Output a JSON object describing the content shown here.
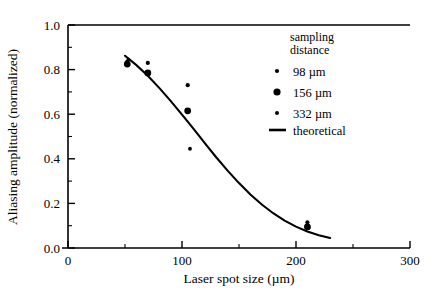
{
  "chart_data": {
    "type": "scatter",
    "title": "",
    "xlabel": "Laser spot size (µm)",
    "ylabel": "Aliasing amplitude (normalized)",
    "xlim": [
      0,
      300
    ],
    "ylim": [
      0.0,
      1.0
    ],
    "xticks": [
      0,
      100,
      200,
      300
    ],
    "xtick_labels": [
      "0",
      "100",
      "200",
      "300"
    ],
    "xticks_minor": [
      50,
      150,
      250
    ],
    "yticks": [
      0.0,
      0.2,
      0.4,
      0.6,
      0.8,
      1.0
    ],
    "ytick_labels": [
      "0.0",
      "0.2",
      "0.4",
      "0.6",
      "0.8",
      "1.0"
    ],
    "yticks_minor": [
      0.1,
      0.3,
      0.5,
      0.7,
      0.9
    ],
    "grid": false,
    "legend_position": "upper right",
    "legend_title": "sampling distance",
    "series": [
      {
        "name": "98 µm",
        "marker": "small-dot",
        "marker_radius": 2.1,
        "points": [
          {
            "x": 52,
            "y": 0.835
          },
          {
            "x": 70,
            "y": 0.83
          },
          {
            "x": 105,
            "y": 0.73
          },
          {
            "x": 210,
            "y": 0.115
          }
        ]
      },
      {
        "name": "156 µm",
        "marker": "large-dot",
        "marker_radius": 3.4,
        "points": [
          {
            "x": 52,
            "y": 0.825
          },
          {
            "x": 70,
            "y": 0.785
          },
          {
            "x": 105,
            "y": 0.615
          },
          {
            "x": 210,
            "y": 0.095
          }
        ]
      },
      {
        "name": "332 µm",
        "marker": "small-dot",
        "marker_radius": 1.9,
        "points": [
          {
            "x": 53,
            "y": 0.845
          },
          {
            "x": 107,
            "y": 0.445
          },
          {
            "x": 211,
            "y": 0.09
          }
        ]
      },
      {
        "name": "theoretical",
        "marker": "line",
        "curve": [
          {
            "x": 50,
            "y": 0.862
          },
          {
            "x": 60,
            "y": 0.82
          },
          {
            "x": 70,
            "y": 0.772
          },
          {
            "x": 80,
            "y": 0.718
          },
          {
            "x": 90,
            "y": 0.66
          },
          {
            "x": 100,
            "y": 0.598
          },
          {
            "x": 110,
            "y": 0.535
          },
          {
            "x": 120,
            "y": 0.47
          },
          {
            "x": 130,
            "y": 0.407
          },
          {
            "x": 140,
            "y": 0.347
          },
          {
            "x": 150,
            "y": 0.291
          },
          {
            "x": 160,
            "y": 0.24
          },
          {
            "x": 170,
            "y": 0.195
          },
          {
            "x": 180,
            "y": 0.156
          },
          {
            "x": 190,
            "y": 0.123
          },
          {
            "x": 200,
            "y": 0.096
          },
          {
            "x": 210,
            "y": 0.074
          },
          {
            "x": 220,
            "y": 0.057
          },
          {
            "x": 230,
            "y": 0.045
          }
        ]
      }
    ]
  },
  "legend": {
    "title_line1": "sampling",
    "title_line2": "distance",
    "entries": [
      {
        "label": "98 µm",
        "marker": "small-dot"
      },
      {
        "label": "156 µm",
        "marker": "large-dot"
      },
      {
        "label": "332 µm",
        "marker": "small-dot"
      },
      {
        "label": "theoretical",
        "marker": "line"
      }
    ]
  },
  "axes": {
    "x_title": "Laser spot size (µm)",
    "y_title": "Aliasing amplitude (normalized)",
    "x_tick_labels": [
      "0",
      "100",
      "200",
      "300"
    ],
    "y_tick_labels": [
      "0.0",
      "0.2",
      "0.4",
      "0.6",
      "0.8",
      "1.0"
    ]
  }
}
